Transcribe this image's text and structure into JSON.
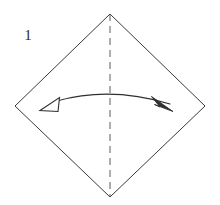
{
  "figure": {
    "step_label": "1",
    "canvas": {
      "width": 220,
      "height": 205,
      "background": "#ffffff"
    },
    "colors": {
      "outline": "#3a3a3a",
      "fold_line": "#5a5a5a",
      "arrow": "#2f2f2f",
      "arrow_fill_solid": "#2f2f2f",
      "arrow_fill_hollow": "#ffffff",
      "label_text": "#2b2b2b",
      "background": "#ffffff"
    },
    "shapes": {
      "paper": {
        "name": "square-sheet-rotated-45",
        "kind": "diamond",
        "fill": "none",
        "stroke_width": 1,
        "vertices": [
          {
            "name": "top",
            "x": 110,
            "y": 14
          },
          {
            "name": "right",
            "x": 205,
            "y": 106
          },
          {
            "name": "bottom",
            "x": 110,
            "y": 197
          },
          {
            "name": "left",
            "x": 15,
            "y": 106
          }
        ]
      },
      "fold_line": {
        "name": "vertical-valley-fold",
        "kind": "dashed-line",
        "x": 110,
        "y1": 14,
        "y2": 197,
        "dash": "7 5",
        "stroke_width": 1
      },
      "arrow": {
        "name": "fold-unfold-double-arrow",
        "kind": "curved-double-headed-arrow",
        "path": "M 57 101 Q 110 86 170 104",
        "stroke_width": 1.2,
        "left_head": {
          "name": "hollow-arrowhead-left",
          "style": "open",
          "points": "40,110 59,98 58,111"
        },
        "right_head": {
          "name": "solid-arrowhead-right",
          "style": "filled",
          "points": "173,111 152,97 159,106 155,104"
        }
      }
    },
    "label_position": {
      "x": 28,
      "y": 40
    }
  }
}
